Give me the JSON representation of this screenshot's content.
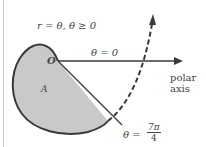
{
  "diagram": {
    "curve_label": "r = θ, θ ≥ 0",
    "ray_label": "θ = 0",
    "origin_label": "O",
    "region_label": "A",
    "polar_axis_label_line1": "polar",
    "polar_axis_label_line2": "axis",
    "end_angle_prefix": "θ =",
    "end_angle_numerator": "7π",
    "end_angle_denominator": "4",
    "colors": {
      "region_fill": "#c9c9c9",
      "outline": "#3a3a3a",
      "text": "#444444",
      "left_edge": "#c8c8c8"
    }
  }
}
